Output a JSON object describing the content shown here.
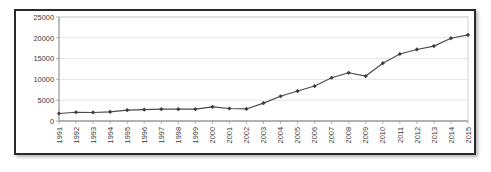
{
  "chart_data": {
    "type": "line",
    "title": "",
    "subtitle": "",
    "xlabel": "",
    "ylabel": "",
    "categories": [
      "1991",
      "1992",
      "1993",
      "1994",
      "1995",
      "1996",
      "1997",
      "1998",
      "1999",
      "2000",
      "2001",
      "2002",
      "2003",
      "2004",
      "2005",
      "2006",
      "2007",
      "2008",
      "2009",
      "2010",
      "2011",
      "2012",
      "2013",
      "2014",
      "2015"
    ],
    "values": [
      1800,
      2100,
      2050,
      2200,
      2600,
      2750,
      2850,
      2850,
      2850,
      3400,
      3000,
      2900,
      4300,
      5950,
      7200,
      8400,
      10400,
      11600,
      10800,
      13900,
      16100,
      17200,
      18000,
      19900,
      20700
    ],
    "series": [
      {
        "name": "series-1",
        "values": [
          1800,
          2100,
          2050,
          2200,
          2600,
          2750,
          2850,
          2850,
          2850,
          3400,
          3000,
          2900,
          4300,
          5950,
          7200,
          8400,
          10400,
          11600,
          10800,
          13900,
          16100,
          17200,
          18000,
          19900,
          20700
        ]
      }
    ],
    "ylim": [
      0,
      25000
    ],
    "yticks": [
      0,
      5000,
      10000,
      15000,
      20000,
      25000
    ],
    "ytick_labels": [
      "0",
      "5000",
      "10000",
      "15000",
      "20000",
      "25000"
    ],
    "grid": {
      "horizontal": true,
      "vertical": false
    },
    "legend": {
      "visible": false,
      "position": "none",
      "entries": []
    },
    "annotations": [],
    "marker": "diamond",
    "xtick_rotation": 90,
    "colors": {
      "line": "#4a4a4a",
      "marker": "#3c3c3c",
      "gridline": "#d9d9d9",
      "axis": "#8a8a8a",
      "plot_border": "#c8c8c8",
      "frame_border": "#2b2b2b",
      "background": "#ffffff",
      "tick_label": "#3a3a3a"
    }
  }
}
